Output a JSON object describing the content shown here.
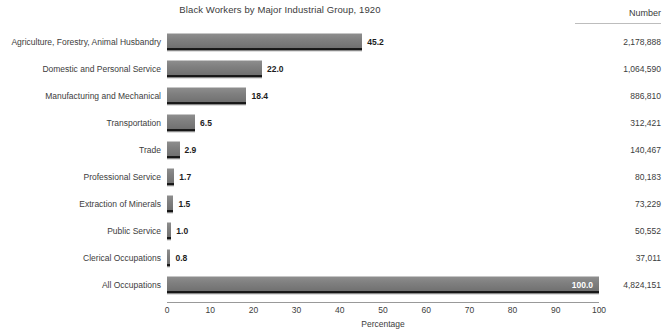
{
  "chart_data": {
    "type": "bar",
    "orientation": "horizontal",
    "title": "Black Workers by Major Industrial Group, 1920",
    "xlabel": "Percentage",
    "ylabel": "",
    "xlim": [
      0,
      100
    ],
    "xticks": [
      0,
      10,
      20,
      30,
      40,
      50,
      60,
      70,
      80,
      90,
      100
    ],
    "xtick_labels": [
      "0",
      "10",
      "20",
      "30",
      "40",
      "50",
      "60",
      "70",
      "80",
      "90",
      "100"
    ],
    "grid": false,
    "legend": null,
    "value_column_header": "Number",
    "categories": [
      "Agriculture, Forestry, Animal Husbandry",
      "Domestic and Personal Service",
      "Manufacturing and Mechanical",
      "Transportation",
      "Trade",
      "Professional Service",
      "Extraction of Minerals",
      "Public Service",
      "Clerical Occupations",
      "All Occupations"
    ],
    "values": [
      45.2,
      22.0,
      18.4,
      6.5,
      2.9,
      1.7,
      1.5,
      1.0,
      0.8,
      100.0
    ],
    "value_labels": [
      "45.2",
      "22.0",
      "18.4",
      "6.5",
      "2.9",
      "1.7",
      "1.5",
      "1.0",
      "0.8",
      "100.0"
    ],
    "counts": [
      2178888,
      1064590,
      886810,
      312421,
      140467,
      80183,
      73229,
      50552,
      37011,
      4824151
    ],
    "count_labels": [
      "2,178,888",
      "1,064,590",
      "886,810",
      "312,421",
      "140,467",
      "80,183",
      "73,229",
      "50,552",
      "37,011",
      "4,824,151"
    ],
    "bar_color": "#7f7f7f",
    "bar_shadow_color": "#1a1a1a",
    "text_color": "#3c3c3c",
    "background_color": "#ffffff"
  },
  "rows": [
    {
      "label": "Agriculture, Forestry, Animal Husbandry",
      "value_label": "45.2",
      "pct": 45.2,
      "count_label": "2,178,888",
      "inside": false
    },
    {
      "label": "Domestic and Personal Service",
      "value_label": "22.0",
      "pct": 22.0,
      "count_label": "1,064,590",
      "inside": false
    },
    {
      "label": "Manufacturing and Mechanical",
      "value_label": "18.4",
      "pct": 18.4,
      "count_label": "886,810",
      "inside": false
    },
    {
      "label": "Transportation",
      "value_label": "6.5",
      "pct": 6.5,
      "count_label": "312,421",
      "inside": false
    },
    {
      "label": "Trade",
      "value_label": "2.9",
      "pct": 2.9,
      "count_label": "140,467",
      "inside": false
    },
    {
      "label": "Professional Service",
      "value_label": "1.7",
      "pct": 1.7,
      "count_label": "80,183",
      "inside": false
    },
    {
      "label": "Extraction of Minerals",
      "value_label": "1.5",
      "pct": 1.5,
      "count_label": "73,229",
      "inside": false
    },
    {
      "label": "Public Service",
      "value_label": "1.0",
      "pct": 1.0,
      "count_label": "50,552",
      "inside": false
    },
    {
      "label": "Clerical Occupations",
      "value_label": "0.8",
      "pct": 0.8,
      "count_label": "37,011",
      "inside": false
    },
    {
      "label": "All Occupations",
      "value_label": "100.0",
      "pct": 100.0,
      "count_label": "4,824,151",
      "inside": true
    }
  ]
}
